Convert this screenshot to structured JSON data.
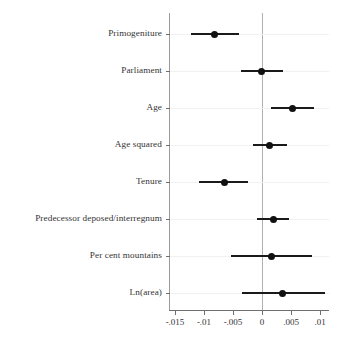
{
  "chart_data": {
    "type": "scatter",
    "title": "",
    "subtitle": "",
    "xlabel": "",
    "ylabel": "",
    "orientation": "horizontal",
    "grid": true,
    "legend": null,
    "xlim": [
      -0.015,
      0.01
    ],
    "xticks": [
      -0.015,
      -0.01,
      -0.005,
      0,
      0.005,
      0.01
    ],
    "xticklabels": [
      "-.015",
      "-.01",
      "-.005",
      "0",
      ".005",
      ".01"
    ],
    "reference_line": 0,
    "categories": [
      "Primogeniture",
      "Parliament",
      "Age",
      "Age squared",
      "Tenure",
      "Predecessor deposed/interregnum",
      "Per cent mountains",
      "Ln(area)"
    ],
    "series": [
      {
        "name": "Coefficient estimate with confidence interval",
        "points": [
          {
            "label": "Primogeniture",
            "estimate": -0.0082,
            "low": -0.0123,
            "high": -0.004
          },
          {
            "label": "Parliament",
            "estimate": -0.0001,
            "low": -0.0036,
            "high": 0.0036
          },
          {
            "label": "Age",
            "estimate": 0.0053,
            "low": 0.0015,
            "high": 0.009
          },
          {
            "label": "Age squared",
            "estimate": 0.0013,
            "low": -0.0016,
            "high": 0.0043
          },
          {
            "label": "Tenure",
            "estimate": -0.0065,
            "low": -0.0108,
            "high": -0.0024
          },
          {
            "label": "Predecessor deposed/interregnum",
            "estimate": 0.0019,
            "low": -0.0009,
            "high": 0.0047
          },
          {
            "label": "Per cent mountains",
            "estimate": 0.0017,
            "low": -0.0054,
            "high": 0.0087
          },
          {
            "label": "Ln(area)",
            "estimate": 0.0036,
            "low": -0.0035,
            "high": 0.0109
          }
        ]
      }
    ]
  },
  "colors": {
    "marker": "#111111",
    "whisker": "#1a1a1a",
    "axis": "#6f6f6f",
    "zero_line": "#b0b0b0",
    "grid": "#f1f1f1",
    "text": "#333333",
    "background": "#ffffff"
  }
}
